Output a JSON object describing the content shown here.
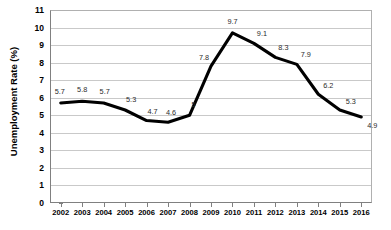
{
  "chart_data": {
    "type": "line",
    "title": "",
    "xlabel": "",
    "ylabel": "Unemployment Rate (%)",
    "ylim": [
      0,
      11
    ],
    "ytick_step": 1,
    "grid": true,
    "legend": "none",
    "line_color": "#000000",
    "grid_color": "#c9c9c9",
    "categories": [
      "2002",
      "2003",
      "2004",
      "2005",
      "2006",
      "2007",
      "2008",
      "2009",
      "2010",
      "2011",
      "2012",
      "2013",
      "2014",
      "2015",
      "2016"
    ],
    "values": [
      5.7,
      5.8,
      5.7,
      5.3,
      4.7,
      4.6,
      5,
      7.8,
      9.7,
      9.1,
      8.3,
      7.9,
      6.2,
      5.3,
      4.9
    ],
    "point_labels": [
      "5.7",
      "5.8",
      "5.7",
      "5.3",
      "4.7",
      "4.6",
      "5",
      "7.8",
      "9.7",
      "9.1",
      "8.3",
      "7.9",
      "6.2",
      "5.3",
      "4.9"
    ],
    "ytick_labels": [
      "11",
      "10",
      "9",
      "8",
      "7",
      "6",
      "5",
      "4",
      "3",
      "2",
      "1",
      "0"
    ]
  }
}
